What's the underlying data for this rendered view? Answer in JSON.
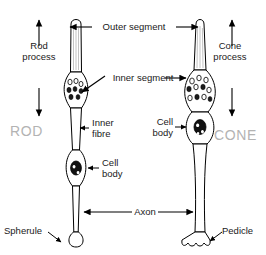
{
  "diagram": {
    "cells": [
      {
        "id": "rod",
        "name_label": "ROD",
        "process_label": "Rod\nprocess",
        "terminal_label": "Spherule"
      },
      {
        "id": "cone",
        "name_label": "CONE",
        "process_label": "Cone\nprocess",
        "terminal_label": "Pedicle"
      }
    ],
    "labels": {
      "outer_segment": "Outer segment",
      "inner_segment": "Inner segment",
      "inner_fibre": "Inner\nfibre",
      "cell_body_rod": "Cell\nbody",
      "cell_body_cone": "Cell\nbody",
      "axon": "Axon",
      "rod_process": "Rod\nprocess",
      "cone_process": "Cone\nprocess",
      "rod_name": "ROD",
      "cone_name": "CONE",
      "spherule": "Spherule",
      "pedicle": "Pedicle"
    },
    "colors": {
      "outline": "#000000",
      "label_text": "#1a1a1a",
      "cell_name_text": "#b3b3b3",
      "background": "#ffffff",
      "nucleus": "#111111"
    }
  }
}
